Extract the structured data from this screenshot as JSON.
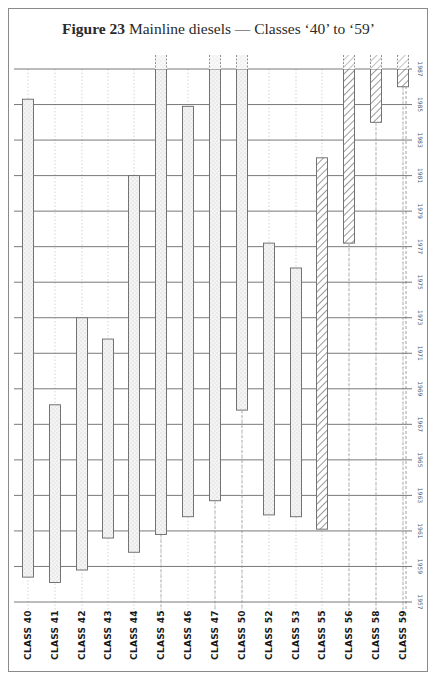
{
  "page": {
    "title_bold": "Figure 23",
    "title_rest": " Mainline diesels — Classes ‘40’ to ‘59’"
  },
  "chart_data": {
    "type": "bar",
    "subtype": "floating-range (service period timeline)",
    "title": "Figure 23 Mainline diesels — Classes ‘40’ to ‘59’",
    "xlabel": "",
    "ylabel": "Year",
    "ylim": [
      1957,
      1987
    ],
    "y_ticks": [
      1957,
      1959,
      1961,
      1963,
      1965,
      1967,
      1969,
      1971,
      1973,
      1975,
      1977,
      1979,
      1981,
      1983,
      1985,
      1987
    ],
    "grid": true,
    "legend": "none (stippled fill = first-generation; hatched fill = later classes; dashed extension above 1987 = still in service)",
    "categories": [
      "CLASS 40",
      "CLASS 41",
      "CLASS 42",
      "CLASS 43",
      "CLASS 44",
      "CLASS 45",
      "CLASS 46",
      "CLASS 47",
      "CLASS 50",
      "CLASS 52",
      "CLASS 53",
      "CLASS 55",
      "CLASS 56",
      "CLASS 58",
      "CLASS 59"
    ],
    "series": [
      {
        "name": "Service period",
        "bars": [
          {
            "class": "CLASS 40",
            "start": 1958.4,
            "end": 1985.3,
            "fill": "stipple",
            "continues": false
          },
          {
            "class": "CLASS 41",
            "start": 1958.1,
            "end": 1968.1,
            "fill": "stipple",
            "continues": false
          },
          {
            "class": "CLASS 42",
            "start": 1958.8,
            "end": 1973.0,
            "fill": "stipple",
            "continues": false
          },
          {
            "class": "CLASS 43",
            "start": 1960.6,
            "end": 1971.8,
            "fill": "stipple",
            "continues": false
          },
          {
            "class": "CLASS 44",
            "start": 1959.8,
            "end": 1981.0,
            "fill": "stipple",
            "continues": false
          },
          {
            "class": "CLASS 45",
            "start": 1960.8,
            "end": 1987.0,
            "fill": "stipple",
            "continues": true
          },
          {
            "class": "CLASS 46",
            "start": 1961.8,
            "end": 1984.9,
            "fill": "stipple",
            "continues": false
          },
          {
            "class": "CLASS 47",
            "start": 1962.7,
            "end": 1987.0,
            "fill": "stipple",
            "continues": true
          },
          {
            "class": "CLASS 50",
            "start": 1967.8,
            "end": 1987.0,
            "fill": "stipple",
            "continues": true
          },
          {
            "class": "CLASS 52",
            "start": 1961.9,
            "end": 1977.2,
            "fill": "stipple",
            "continues": false
          },
          {
            "class": "CLASS 53",
            "start": 1961.8,
            "end": 1975.8,
            "fill": "stipple",
            "continues": false
          },
          {
            "class": "CLASS 55",
            "start": 1961.1,
            "end": 1982.0,
            "fill": "hatch",
            "continues": false
          },
          {
            "class": "CLASS 56",
            "start": 1977.2,
            "end": 1987.0,
            "fill": "hatch",
            "continues": true
          },
          {
            "class": "CLASS 58",
            "start": 1984.0,
            "end": 1987.0,
            "fill": "hatch",
            "continues": true
          },
          {
            "class": "CLASS 59",
            "start": 1986.0,
            "end": 1987.0,
            "fill": "hatch",
            "continues": true
          }
        ]
      }
    ]
  }
}
